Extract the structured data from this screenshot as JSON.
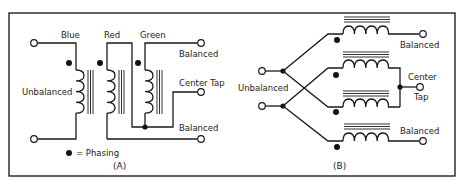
{
  "figure": {
    "colors": {
      "line": "#1a1a1a",
      "background": "#ffffff"
    },
    "panel_a": {
      "caption": "(A)",
      "labels": {
        "blue": "Blue",
        "red": "Red",
        "green": "Green",
        "unbalanced": "Unbalanced",
        "balanced_top": "Balanced",
        "center_tap": "Center Tap",
        "balanced_bottom": "Balanced"
      },
      "legend": {
        "symbol": "dot-icon",
        "text": "= Phasing"
      }
    },
    "panel_b": {
      "caption": "(B)",
      "labels": {
        "unbalanced": "Unbalanced",
        "balanced_top": "Balanced",
        "center": "Center",
        "tap": "Tap",
        "balanced_bottom": "Balanced"
      }
    }
  }
}
